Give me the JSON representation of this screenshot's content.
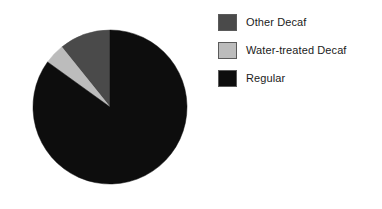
{
  "chart_data": {
    "type": "pie",
    "title": "",
    "subtitle": "",
    "xlabel": "",
    "ylabel": "",
    "grid": false,
    "legend_position": "right",
    "start_angle_deg": 0,
    "direction": "counterclockwise",
    "categories": [
      "Other Decaf",
      "Water-treated Decaf",
      "Regular"
    ],
    "values": [
      10.8,
      4.3,
      84.9
    ],
    "value_unit": "percent",
    "colors": [
      "#4a4a4a",
      "#bcbcbc",
      "#0d0d0d"
    ],
    "slices": [
      {
        "label": "Other Decaf",
        "value": 10.8,
        "angle_deg": 38.8,
        "color": "#4a4a4a"
      },
      {
        "label": "Water-treated Decaf",
        "value": 4.3,
        "angle_deg": 15.4,
        "color": "#bcbcbc"
      },
      {
        "label": "Regular",
        "value": 84.9,
        "angle_deg": 305.8,
        "color": "#0d0d0d"
      }
    ]
  },
  "legend": {
    "items": [
      {
        "label": "Other Decaf",
        "color": "#4a4a4a",
        "swatch_name": "legend-swatch-other-decaf"
      },
      {
        "label": "Water-treated Decaf",
        "color": "#bcbcbc",
        "swatch_name": "legend-swatch-water-treated-decaf"
      },
      {
        "label": "Regular",
        "color": "#0d0d0d",
        "swatch_name": "legend-swatch-regular"
      }
    ]
  },
  "geometry": {
    "center_x": 110,
    "center_y": 107,
    "radius": 77
  }
}
